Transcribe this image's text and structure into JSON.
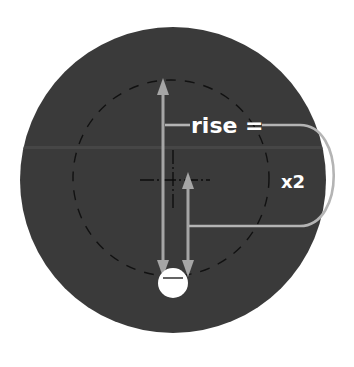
{
  "diagram": {
    "labels": {
      "rise": "rise =",
      "multiplier": "x2"
    },
    "colors": {
      "background": "#ffffff",
      "disc": "#3a3a3a",
      "disc_band": "#464646",
      "arrow": "#a6a6a6",
      "bracket": "#b4b4b4",
      "label_text": "#ffffff",
      "dashed_circle": "#111111",
      "crosshair": "#0c0c0c",
      "hole": "#ffffff"
    },
    "elements": {
      "disc": {
        "cx": 173,
        "cy": 180,
        "r": 153
      },
      "pitch_circle": {
        "cx": 171,
        "cy": 178,
        "r": 98,
        "style": "dashed"
      },
      "center_crosshair": {
        "cx": 173,
        "cy": 180
      },
      "hole": {
        "cx": 173,
        "cy": 283,
        "r": 15
      },
      "long_arrow": {
        "x": 163,
        "y_top": 78,
        "y_bottom": 277,
        "meaning": "full span"
      },
      "short_arrow": {
        "x": 188,
        "y_top": 172,
        "y_bottom": 277,
        "meaning": "rise"
      }
    }
  }
}
